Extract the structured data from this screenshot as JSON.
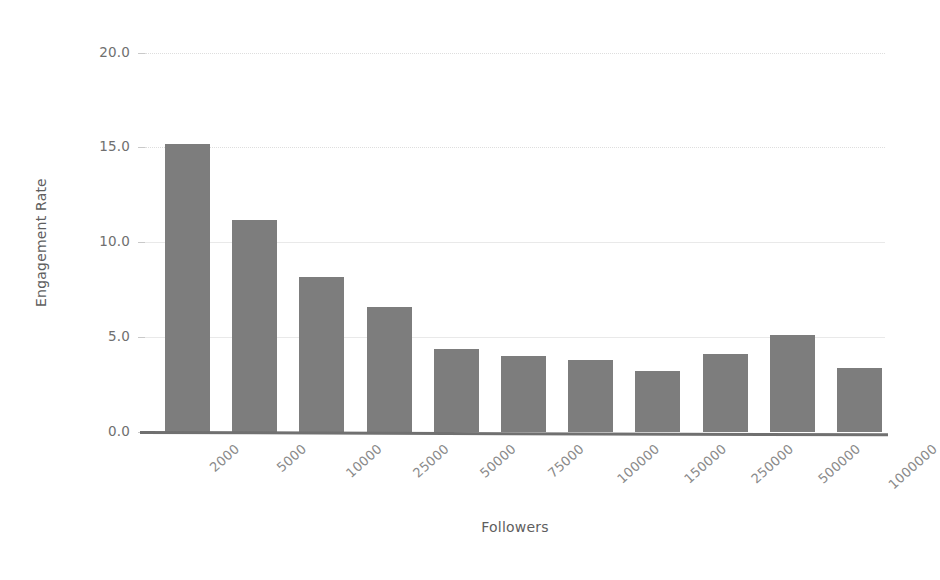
{
  "chart_data": {
    "type": "bar",
    "title": "",
    "subtitle": "",
    "xlabel": "Followers",
    "ylabel": "Engagement Rate",
    "categories": [
      "2000",
      "5000",
      "10000",
      "25000",
      "50000",
      "75000",
      "100000",
      "150000",
      "250000",
      "500000",
      "1000000"
    ],
    "values": [
      15.2,
      11.2,
      8.2,
      6.6,
      4.4,
      4.0,
      3.8,
      3.2,
      4.1,
      5.1,
      3.4
    ],
    "ylim": [
      0.0,
      20.0
    ],
    "yticks": [
      0.0,
      5.0,
      10.0,
      15.0,
      20.0
    ],
    "ytick_labels": [
      "0.0",
      "5.0",
      "10.0",
      "15.0",
      "20.0"
    ],
    "grid": true,
    "legend": null,
    "legend_position": "none",
    "bar_color": "#7d7d7d",
    "grid_color": "#e9e9e9",
    "axis_color": "#707070",
    "text_color": "#6b6b6b",
    "background_color": "#ffffff",
    "xtick_rotation": -42
  }
}
